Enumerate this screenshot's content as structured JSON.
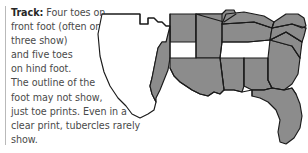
{
  "figure": {
    "kind": "field-guide-caption-with-range-map",
    "background_color": "#ffffff"
  },
  "rule": {
    "name": "left-vertical-rule",
    "color": "#b9b9b9"
  },
  "caption": {
    "label": "Track:",
    "text_color": "#4a4a4a",
    "label_color": "#272727",
    "lines": [
      " Four toes on",
      "front foot (often only",
      "three show)",
      "and five toes",
      "on hind foot.",
      "The outline of the",
      "foot may not show,",
      "just toe prints. Even in a",
      "clear print, tubercles rarely",
      "show."
    ],
    "full_text": "Track: Four toes on front foot (often only three show) and five toes on hind foot. The outline of the foot may not show, just toe prints. Even in a clear print, tubercles rarely show."
  },
  "map": {
    "name": "range-map-southeastern-united-states",
    "region": "Southeastern United States",
    "shaded_color": "#8c8c8c",
    "unshaded_color": "#ffffff",
    "outline_color": "#1a1a1a",
    "shaded_states": [
      "Oklahoma (eastern)",
      "Arkansas",
      "Louisiana",
      "Mississippi",
      "Alabama",
      "Tennessee",
      "Kentucky",
      "Missouri (southeastern)",
      "Georgia",
      "Florida",
      "South Carolina",
      "North Carolina",
      "Virginia",
      "Texas (eastern strip)"
    ],
    "unshaded_states": [
      "Texas (central and western)",
      "Oklahoma (western)"
    ]
  }
}
